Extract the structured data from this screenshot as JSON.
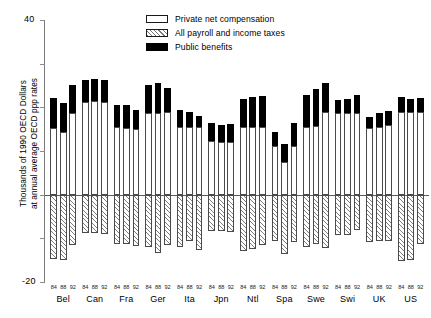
{
  "chart_data": {
    "type": "bar",
    "title": "",
    "subtitle": "",
    "xlabel": "",
    "ylabel": "Thousands of 1990 OECD Dollars\nat annual average OECD ppp rates",
    "ylim": [
      -20,
      40
    ],
    "ytick_labels": [
      "40",
      "-20"
    ],
    "ytick_values": [
      40,
      -20
    ],
    "grid": false,
    "stacked": true,
    "zero_line": 0,
    "legend_position": "top-center",
    "legend": [
      {
        "label": "Private net compensation",
        "pattern": "open",
        "color": "#ffffff"
      },
      {
        "label": "All payroll and income taxes",
        "pattern": "hatched",
        "color": "#ffffff"
      },
      {
        "label": "Public benefits",
        "pattern": "solid",
        "color": "#000000"
      }
    ],
    "groups": [
      "Bel",
      "Can",
      "Fra",
      "Ger",
      "Ita",
      "Jpn",
      "Ntl",
      "Spa",
      "Swe",
      "Swi",
      "UK",
      "US"
    ],
    "years": [
      "84",
      "88",
      "92"
    ],
    "categories": [
      "Bel 84",
      "Bel 88",
      "Bel 92",
      "Can 84",
      "Can 88",
      "Can 92",
      "Fra 84",
      "Fra 88",
      "Fra 92",
      "Ger 84",
      "Ger 88",
      "Ger 92",
      "Ita 84",
      "Ita 88",
      "Ita 92",
      "Jpn 84",
      "Jpn 88",
      "Jpn 92",
      "Ntl 84",
      "Ntl 88",
      "Ntl 92",
      "Spa 84",
      "Spa 88",
      "Spa 92",
      "Swe 84",
      "Swe 88",
      "Swe 92",
      "Swi 84",
      "Swi 88",
      "Swi 92",
      "UK 84",
      "UK 88",
      "UK 92",
      "US 84",
      "US 88",
      "US 92"
    ],
    "series": [
      {
        "name": "Private net compensation",
        "values": [
          15.3,
          14.4,
          18.8,
          21.3,
          21.5,
          21.3,
          15.4,
          15.3,
          15.0,
          18.7,
          18.8,
          18.9,
          15.4,
          15.6,
          15.4,
          12.3,
          12.1,
          12.1,
          15.6,
          15.4,
          15.6,
          11.2,
          7.5,
          11.2,
          15.6,
          15.8,
          18.9,
          18.6,
          18.6,
          18.8,
          15.3,
          15.6,
          16.0,
          18.9,
          19.0,
          19.0
        ]
      },
      {
        "name": "Public benefits",
        "values": [
          6.9,
          6.6,
          6.3,
          5.0,
          5.1,
          4.9,
          5.2,
          5.3,
          4.4,
          6.5,
          6.7,
          5.5,
          4.0,
          3.3,
          2.6,
          4.1,
          3.9,
          4.0,
          6.2,
          6.9,
          7.0,
          3.2,
          4.2,
          5.2,
          7.2,
          8.3,
          6.7,
          3.1,
          3.2,
          4.0,
          2.5,
          3.1,
          3.2,
          3.4,
          3.0,
          3.1
        ]
      },
      {
        "name": "All payroll and income taxes",
        "values": [
          -14.8,
          -14.9,
          -11.6,
          -8.8,
          -8.8,
          -9.0,
          -11.2,
          -11.3,
          -11.8,
          -12.1,
          -13.4,
          -11.5,
          -12.1,
          -10.6,
          -12.6,
          -8.4,
          -8.4,
          -8.6,
          -13.0,
          -12.4,
          -11.6,
          -10.5,
          -13.5,
          -10.8,
          -12.0,
          -11.2,
          -12.3,
          -9.3,
          -9.2,
          -8.2,
          -10.9,
          -10.7,
          -10.7,
          -15.1,
          -14.9,
          -11.2
        ]
      }
    ]
  }
}
